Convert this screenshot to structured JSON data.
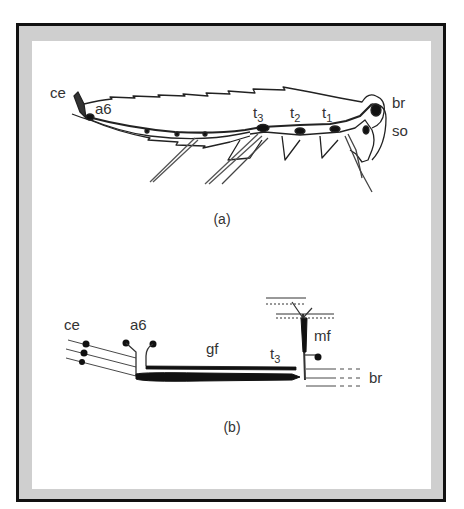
{
  "figure": {
    "frame": {
      "border_color": "#111111",
      "band_color": "#cfcfcf",
      "background": "#ffffff"
    },
    "panel_a": {
      "caption": "(a)",
      "subject": "insect (cockroach) side view with ventral nerve cord",
      "labels": {
        "ce": "ce",
        "a6": "a6",
        "t3": "t",
        "t3_sub": "3",
        "t2": "t",
        "t2_sub": "2",
        "t1": "t",
        "t1_sub": "1",
        "br": "br",
        "so": "so"
      }
    },
    "panel_b": {
      "caption": "(b)",
      "subject": "schematic of giant fibre pathway",
      "labels": {
        "ce": "ce",
        "a6": "a6",
        "gf": "gf",
        "t3": "t",
        "t3_sub": "3",
        "mf": "mf",
        "br": "br"
      }
    }
  }
}
